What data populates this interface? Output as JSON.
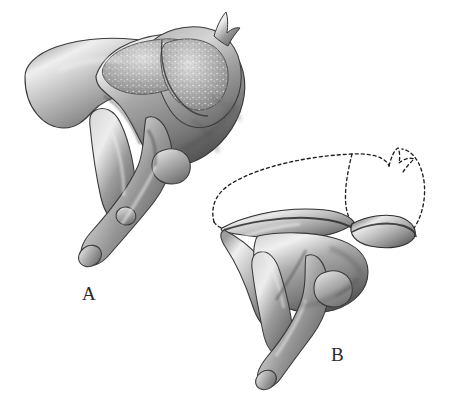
{
  "figure": {
    "background_color": "#ffffff",
    "width": 453,
    "height": 409,
    "style": "grayscale anatomical wash drawing, stippled articular surfaces",
    "panels": [
      {
        "id": "A",
        "label": "A",
        "label_x": 82,
        "label_y": 283,
        "description": "Complete articulated malleus and incus seen from behind; heads and body intact with stippled articular facets",
        "has_dashed_outline": false
      },
      {
        "id": "B",
        "label": "B",
        "label_x": 331,
        "label_y": 344,
        "description": "Same ossicles with head of malleus and body of incus removed; removed parts indicated by dashed ghost outline",
        "has_dashed_outline": true
      }
    ],
    "ink": {
      "outline": "#2b2b2b",
      "shadow_dark": "#4a4a4a",
      "mid_tone": "#8d8d8d",
      "light_tone": "#bdbdbd",
      "highlight": "#f2f2f2",
      "dash_stroke": "#1f1f1f"
    },
    "dash_pattern": "3 3"
  }
}
